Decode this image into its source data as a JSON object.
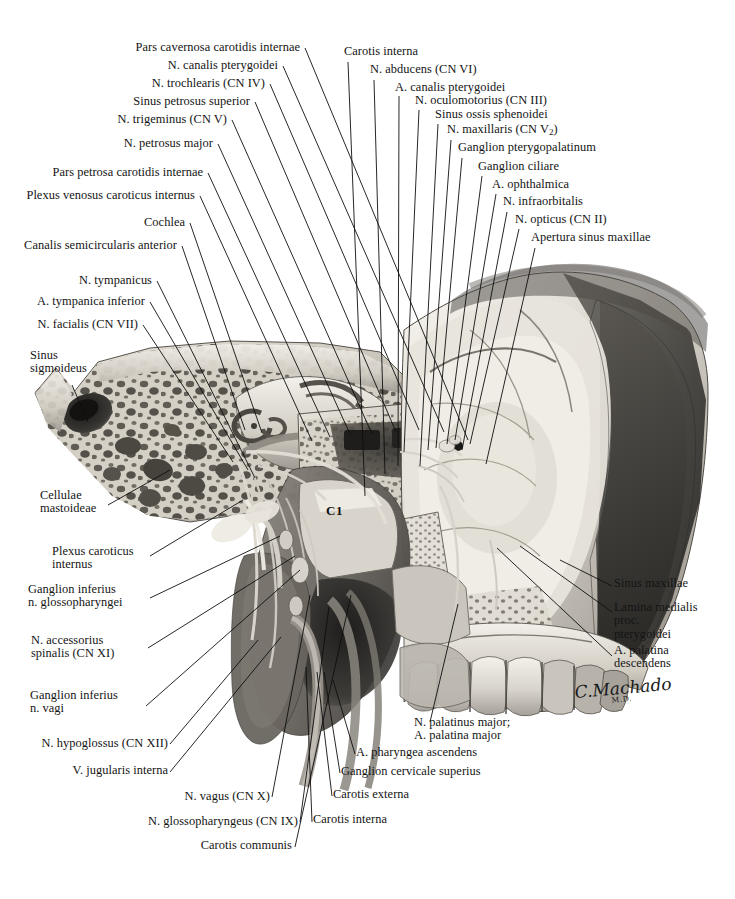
{
  "plate": {
    "title": "Sagittal section of skull base, pterygopalatine fossa and carotid canal",
    "signature": "C.Machado",
    "signature_suffix": "M.D.",
    "vertebra_label": "C1",
    "background_color": "#ffffff",
    "ink_color": "#0f0f0f"
  },
  "labels_upper_left": [
    {
      "text": "Pars cavernosa carotidis internae",
      "x": 300,
      "y": 52
    },
    {
      "text": "N. canalis pterygoidei",
      "x": 278,
      "y": 70
    },
    {
      "text": "N. trochlearis (CN IV)",
      "x": 265,
      "y": 88
    },
    {
      "text": "Sinus petrosus superior",
      "x": 250,
      "y": 106
    },
    {
      "text": "N. trigeminus (CN V)",
      "x": 227,
      "y": 124
    },
    {
      "text": "N. petrosus major",
      "x": 213,
      "y": 148
    },
    {
      "text": "Pars petrosa carotidis internae",
      "x": 203,
      "y": 177
    },
    {
      "text": "Plexus venosus caroticus internus",
      "x": 195,
      "y": 200
    },
    {
      "text": "Cochlea",
      "x": 185,
      "y": 227
    },
    {
      "text": "Canalis semicircularis anterior",
      "x": 177,
      "y": 250
    },
    {
      "text": "N. tympanicus",
      "x": 152,
      "y": 285
    },
    {
      "text": "A. tympanica inferior",
      "x": 145,
      "y": 306
    },
    {
      "text": "N. facialis (CN VII)",
      "x": 138,
      "y": 329
    }
  ],
  "labels_left_block": [
    {
      "lines": [
        "Sinus",
        "sigmoideus"
      ],
      "x": 30,
      "y": 360
    },
    {
      "lines": [
        "Cellulae",
        "mastoideae"
      ],
      "x": 40,
      "y": 500
    },
    {
      "lines": [
        "Plexus caroticus",
        "internus"
      ],
      "x": 52,
      "y": 556
    },
    {
      "lines": [
        "Ganglion inferius",
        "n. glossopharyngei"
      ],
      "x": 28,
      "y": 594
    },
    {
      "lines": [
        "N. accessorius",
        "spinalis (CN XI)"
      ],
      "x": 31,
      "y": 645
    },
    {
      "lines": [
        "Ganglion inferius",
        "n. vagi"
      ],
      "x": 30,
      "y": 700
    }
  ],
  "labels_lower_left": [
    {
      "text": "N. hypoglossus (CN XII)",
      "x": 168,
      "y": 748
    },
    {
      "text": "V. jugularis interna",
      "x": 168,
      "y": 775
    },
    {
      "text": "N. vagus (CN X)",
      "x": 270,
      "y": 801
    },
    {
      "text": "N. glossopharyngeus (CN IX)",
      "x": 298,
      "y": 826
    },
    {
      "text": "Carotis communis",
      "x": 292,
      "y": 850
    }
  ],
  "labels_upper_right": [
    {
      "text": "Carotis interna",
      "x": 344,
      "y": 56
    },
    {
      "text": "N. abducens (CN VI)",
      "x": 370,
      "y": 74
    },
    {
      "text": "A. canalis pterygoidei",
      "x": 395,
      "y": 92
    },
    {
      "text": "N. oculomotorius (CN III)",
      "x": 415,
      "y": 105
    },
    {
      "text": "Sinus ossis sphenoidei",
      "x": 435,
      "y": 119
    },
    {
      "text": "N. maxillaris (CN V",
      "x": 447,
      "y": 134,
      "sub": "2",
      "tail": ")"
    },
    {
      "text": "Ganglion pterygopalatinum",
      "x": 458,
      "y": 152
    },
    {
      "text": "Ganglion ciliare",
      "x": 478,
      "y": 171
    },
    {
      "text": "A. ophthalmica",
      "x": 492,
      "y": 189
    },
    {
      "text": "N. infraorbitalis",
      "x": 503,
      "y": 206
    },
    {
      "text": "N. opticus (CN II)",
      "x": 515,
      "y": 224
    },
    {
      "text": "Apertura sinus maxillae",
      "x": 531,
      "y": 242
    }
  ],
  "labels_right_block": [
    {
      "lines": [
        "Sinus maxillae"
      ],
      "x": 614,
      "y": 588
    },
    {
      "lines": [
        "Lamina medialis",
        "proc.",
        "pterygoidei"
      ],
      "x": 614,
      "y": 612
    },
    {
      "lines": [
        "A. palatina",
        "descendens"
      ],
      "x": 614,
      "y": 655
    }
  ],
  "labels_lower_right": [
    {
      "lines": [
        "N. palatinus major;",
        "A. palatina major"
      ],
      "x": 414,
      "y": 727
    },
    {
      "lines": [
        "A. pharyngea ascendens"
      ],
      "x": 356,
      "y": 757
    },
    {
      "lines": [
        "Ganglion cervicale superius"
      ],
      "x": 341,
      "y": 776
    },
    {
      "lines": [
        "Carotis externa"
      ],
      "x": 333,
      "y": 799
    },
    {
      "lines": [
        "Carotis interna"
      ],
      "x": 313,
      "y": 824
    }
  ],
  "leaders": {
    "description": "thin straight ink leader lines from each label to its anatomical target",
    "upper_left": [
      [
        305,
        48,
        468,
        440
      ],
      [
        283,
        66,
        444,
        432
      ],
      [
        270,
        84,
        419,
        430
      ],
      [
        255,
        102,
        396,
        432
      ],
      [
        232,
        120,
        372,
        434
      ],
      [
        218,
        144,
        350,
        434
      ],
      [
        208,
        173,
        330,
        437
      ],
      [
        200,
        196,
        312,
        441
      ],
      [
        190,
        223,
        262,
        433
      ],
      [
        182,
        246,
        245,
        430
      ],
      [
        157,
        281,
        255,
        478
      ],
      [
        150,
        302,
        248,
        470
      ],
      [
        143,
        325,
        233,
        462
      ]
    ],
    "left_block": [
      [
        72,
        385,
        88,
        422
      ],
      [
        108,
        505,
        170,
        470
      ],
      [
        150,
        556,
        243,
        500
      ],
      [
        150,
        598,
        280,
        536
      ],
      [
        148,
        648,
        295,
        556
      ],
      [
        146,
        706,
        300,
        570
      ]
    ],
    "lower_left": [
      [
        170,
        744,
        258,
        640
      ],
      [
        170,
        772,
        281,
        637
      ],
      [
        272,
        797,
        310,
        595
      ],
      [
        300,
        822,
        329,
        607
      ],
      [
        295,
        847,
        351,
        595
      ]
    ],
    "upper_right": [
      [
        348,
        62,
        365,
        496
      ],
      [
        374,
        80,
        385,
        474
      ],
      [
        399,
        96,
        398,
        466
      ],
      [
        419,
        110,
        404,
        452
      ],
      [
        438,
        124,
        420,
        466
      ],
      [
        451,
        140,
        428,
        450
      ],
      [
        462,
        158,
        436,
        448
      ],
      [
        482,
        176,
        447,
        444
      ],
      [
        496,
        194,
        455,
        440
      ],
      [
        507,
        212,
        462,
        450
      ],
      [
        519,
        229,
        470,
        444
      ],
      [
        535,
        248,
        486,
        464
      ]
    ],
    "right_block": [
      [
        612,
        586,
        560,
        560
      ],
      [
        612,
        612,
        520,
        546
      ],
      [
        612,
        656,
        497,
        548
      ]
    ],
    "lower_right": [
      [
        430,
        722,
        458,
        604
      ],
      [
        355,
        754,
        333,
        680
      ],
      [
        340,
        773,
        324,
        672
      ],
      [
        332,
        796,
        317,
        672
      ],
      [
        312,
        822,
        306,
        667
      ]
    ]
  }
}
